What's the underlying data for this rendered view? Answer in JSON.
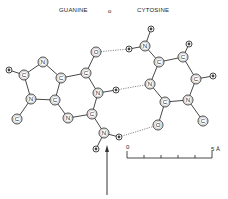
{
  "title": {
    "left": "GUANINE",
    "separator": "o",
    "right": "CYTOSINE"
  },
  "atoms": [
    {
      "id": "g_h8",
      "el": "H",
      "x": 9,
      "y": 70,
      "r": 3,
      "mol": "guanine"
    },
    {
      "id": "g_c8",
      "el": "C",
      "x": 24,
      "y": 75,
      "r": 5,
      "mol": "guanine"
    },
    {
      "id": "g_n7",
      "el": "N",
      "x": 43,
      "y": 62,
      "r": 5,
      "mol": "guanine"
    },
    {
      "id": "g_c5",
      "el": "C",
      "x": 61,
      "y": 78,
      "r": 5,
      "mol": "guanine"
    },
    {
      "id": "g_c6",
      "el": "C",
      "x": 86,
      "y": 73,
      "r": 5,
      "mol": "guanine"
    },
    {
      "id": "g_o6",
      "el": "O",
      "x": 96,
      "y": 52,
      "r": 5,
      "mol": "guanine"
    },
    {
      "id": "g_n1",
      "el": "N",
      "x": 98,
      "y": 93,
      "r": 5,
      "mol": "guanine"
    },
    {
      "id": "g_h1",
      "el": "H",
      "x": 116,
      "y": 90,
      "r": 3,
      "mol": "guanine"
    },
    {
      "id": "g_c2",
      "el": "C",
      "x": 92,
      "y": 114,
      "r": 5,
      "mol": "guanine"
    },
    {
      "id": "g_n2",
      "el": "N",
      "x": 104,
      "y": 133,
      "r": 5,
      "mol": "guanine"
    },
    {
      "id": "g_h2a",
      "el": "H",
      "x": 119,
      "y": 137,
      "r": 3,
      "mol": "guanine"
    },
    {
      "id": "g_h2b",
      "el": "H",
      "x": 96,
      "y": 149,
      "r": 3,
      "mol": "guanine"
    },
    {
      "id": "g_n3",
      "el": "N",
      "x": 68,
      "y": 118,
      "r": 5,
      "mol": "guanine"
    },
    {
      "id": "g_c4",
      "el": "C",
      "x": 55,
      "y": 100,
      "r": 5,
      "mol": "guanine"
    },
    {
      "id": "g_n9",
      "el": "N",
      "x": 31,
      "y": 99,
      "r": 5,
      "mol": "guanine"
    },
    {
      "id": "g_c1",
      "el": "C",
      "x": 17,
      "y": 119,
      "r": 5,
      "mol": "guanine"
    },
    {
      "id": "c_h4a",
      "el": "H",
      "x": 129,
      "y": 49,
      "r": 3,
      "mol": "cytosine"
    },
    {
      "id": "c_n4",
      "el": "N",
      "x": 145,
      "y": 46,
      "r": 5,
      "mol": "cytosine"
    },
    {
      "id": "c_h4b",
      "el": "H",
      "x": 151,
      "y": 29,
      "r": 3,
      "mol": "cytosine"
    },
    {
      "id": "c_c4",
      "el": "C",
      "x": 159,
      "y": 62,
      "r": 5,
      "mol": "cytosine"
    },
    {
      "id": "c_c5",
      "el": "C",
      "x": 183,
      "y": 57,
      "r": 5,
      "mol": "cytosine"
    },
    {
      "id": "c_h5",
      "el": "H",
      "x": 189,
      "y": 44,
      "r": 3,
      "mol": "cytosine"
    },
    {
      "id": "c_c6",
      "el": "C",
      "x": 196,
      "y": 79,
      "r": 5,
      "mol": "cytosine"
    },
    {
      "id": "c_h6",
      "el": "H",
      "x": 213,
      "y": 76,
      "r": 3,
      "mol": "cytosine"
    },
    {
      "id": "c_n1",
      "el": "N",
      "x": 188,
      "y": 100,
      "r": 5,
      "mol": "cytosine"
    },
    {
      "id": "c_c1",
      "el": "C",
      "x": 203,
      "y": 121,
      "r": 5,
      "mol": "cytosine"
    },
    {
      "id": "c_c2",
      "el": "C",
      "x": 165,
      "y": 102,
      "r": 5,
      "mol": "cytosine"
    },
    {
      "id": "c_o2",
      "el": "O",
      "x": 158,
      "y": 125,
      "r": 5,
      "mol": "cytosine"
    },
    {
      "id": "c_n3",
      "el": "N",
      "x": 150,
      "y": 84,
      "r": 5,
      "mol": "cytosine"
    }
  ],
  "bonds": [
    [
      "g_h8",
      "g_c8"
    ],
    [
      "g_c8",
      "g_n7"
    ],
    [
      "g_n7",
      "g_c5"
    ],
    [
      "g_c5",
      "g_c6"
    ],
    [
      "g_c6",
      "g_o6"
    ],
    [
      "g_c6",
      "g_n1"
    ],
    [
      "g_n1",
      "g_h1"
    ],
    [
      "g_n1",
      "g_c2"
    ],
    [
      "g_c2",
      "g_n2"
    ],
    [
      "g_n2",
      "g_h2a"
    ],
    [
      "g_n2",
      "g_h2b"
    ],
    [
      "g_c2",
      "g_n3"
    ],
    [
      "g_n3",
      "g_c4"
    ],
    [
      "g_c4",
      "g_c5"
    ],
    [
      "g_c4",
      "g_n9"
    ],
    [
      "g_n9",
      "g_c8"
    ],
    [
      "g_n9",
      "g_c1"
    ],
    [
      "c_h4a",
      "c_n4"
    ],
    [
      "c_n4",
      "c_h4b"
    ],
    [
      "c_n4",
      "c_c4"
    ],
    [
      "c_c4",
      "c_c5"
    ],
    [
      "c_c5",
      "c_h5"
    ],
    [
      "c_c5",
      "c_c6"
    ],
    [
      "c_c6",
      "c_h6"
    ],
    [
      "c_c6",
      "c_n1"
    ],
    [
      "c_n1",
      "c_c1"
    ],
    [
      "c_n1",
      "c_c2"
    ],
    [
      "c_c2",
      "c_o2"
    ],
    [
      "c_c2",
      "c_n3"
    ],
    [
      "c_n3",
      "c_c4"
    ]
  ],
  "hbonds": [
    [
      "g_o6",
      "c_h4a"
    ],
    [
      "g_h1",
      "c_n3"
    ],
    [
      "g_h2a",
      "c_o2"
    ]
  ],
  "arrow": {
    "x": 107,
    "y_from": 195,
    "y_to": 145
  },
  "scale_bar": {
    "start_label": "0",
    "end_label": "5 Å",
    "x_start": 127,
    "x_end": 212,
    "y": 158,
    "ticks": 6
  }
}
